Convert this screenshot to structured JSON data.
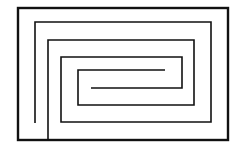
{
  "diagram": {
    "type": "maze-spiral",
    "background": "#ffffff",
    "stroke_color": "#111111",
    "frame": {
      "x": 18,
      "y": 8,
      "width": 210,
      "height": 132,
      "stroke_width": 2.4
    },
    "paths": [
      {
        "name": "spiral-wall-a",
        "points": "35,123 35,22 211,22 211,122 61,122 61,57 182,57 182,88 91,88",
        "stroke_width": 1.6
      },
      {
        "name": "spiral-wall-b",
        "points": "48,140 48,40 194,40 194,105 78,105 78,70 165,70",
        "stroke_width": 1.6
      }
    ]
  }
}
